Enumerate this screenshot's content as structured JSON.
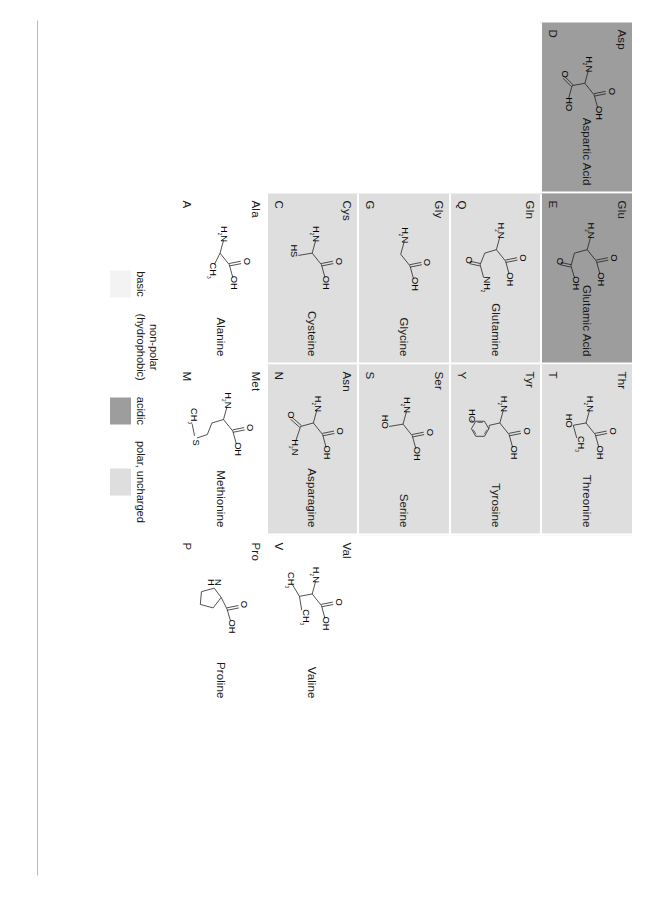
{
  "chart_data": {
    "type": "table",
    "orientation": "rotated-90-clockwise",
    "columns": [
      "one_letter_code",
      "three_letter_abbr",
      "structure",
      "full_name",
      "category"
    ],
    "grid_rows": 5,
    "grid_cols": 5,
    "colors": {
      "acidic": "#9d9d9d",
      "polar_uncharged": "#dedede",
      "basic": "#f3f3f3",
      "non_polar": "#ffffff",
      "page_rule": "#b9b9b9"
    },
    "legend": {
      "position": "below-grid-center",
      "entries": [
        {
          "label": "basic",
          "swatch": "#f3f3f3",
          "key": "basic"
        },
        {
          "label": "non-polar\n(hydrophobic)",
          "swatch": "#ffffff",
          "key": "non-polar"
        },
        {
          "label": "acidic",
          "swatch": "#9d9d9d",
          "key": "acidic"
        },
        {
          "label": "polar, uncharged",
          "swatch": "#dedede",
          "key": "polar"
        }
      ]
    },
    "cells": [
      {
        "code": "D",
        "abbr": "Asp",
        "name": "Aspartic Acid",
        "category": "acidic",
        "filled": true
      },
      {
        "code": "E",
        "abbr": "Glu",
        "name": "Glutamic Acid",
        "category": "acidic",
        "filled": true
      },
      {
        "code": "T",
        "abbr": "Thr",
        "name": "Threonine",
        "category": "polar",
        "filled": true
      },
      {
        "code": "",
        "abbr": "",
        "name": "",
        "category": "empty",
        "filled": false
      },
      {
        "code": "",
        "abbr": "",
        "name": "",
        "category": "empty",
        "filled": false
      },
      {
        "code": "",
        "abbr": "",
        "name": "",
        "category": "empty",
        "filled": false
      },
      {
        "code": "Q",
        "abbr": "Gln",
        "name": "Glutamine",
        "category": "polar",
        "filled": true
      },
      {
        "code": "Y",
        "abbr": "Tyr",
        "name": "Tyrosine",
        "category": "polar",
        "filled": true
      },
      {
        "code": "",
        "abbr": "",
        "name": "",
        "category": "empty",
        "filled": false
      },
      {
        "code": "",
        "abbr": "",
        "name": "",
        "category": "empty",
        "filled": false
      },
      {
        "code": "",
        "abbr": "",
        "name": "",
        "category": "empty",
        "filled": false
      },
      {
        "code": "G",
        "abbr": "Gly",
        "name": "Glycine",
        "category": "polar",
        "filled": true
      },
      {
        "code": "S",
        "abbr": "Ser",
        "name": "Serine",
        "category": "polar",
        "filled": true
      },
      {
        "code": "",
        "abbr": "",
        "name": "",
        "category": "empty",
        "filled": false
      },
      {
        "code": "",
        "abbr": "",
        "name": "",
        "category": "empty",
        "filled": false
      },
      {
        "code": "",
        "abbr": "",
        "name": "",
        "category": "empty",
        "filled": false
      },
      {
        "code": "C",
        "abbr": "Cys",
        "name": "Cysteine",
        "category": "polar",
        "filled": true
      },
      {
        "code": "N",
        "abbr": "Asn",
        "name": "Asparagine",
        "category": "polar",
        "filled": true
      },
      {
        "code": "V",
        "abbr": "Val",
        "name": "Valine",
        "category": "non-polar",
        "filled": true
      },
      {
        "code": "",
        "abbr": "",
        "name": "",
        "category": "empty",
        "filled": false
      },
      {
        "code": "",
        "abbr": "",
        "name": "",
        "category": "empty",
        "filled": false
      },
      {
        "code": "A",
        "abbr": "Ala",
        "name": "Alanine",
        "category": "non-polar",
        "filled": true
      },
      {
        "code": "M",
        "abbr": "Met",
        "name": "Methionine",
        "category": "non-polar",
        "filled": true
      },
      {
        "code": "P",
        "abbr": "Pro",
        "name": "Proline",
        "category": "non-polar",
        "filled": true
      },
      {
        "code": "",
        "abbr": "",
        "name": "",
        "category": "empty",
        "filled": false
      },
      {
        "code": "F",
        "abbr": "Phe",
        "name": "Phenylalanine",
        "category": "non-polar",
        "filled": true
      },
      {
        "code": "L",
        "abbr": "Leu",
        "name": "Leucine",
        "category": "non-polar",
        "filled": true
      },
      {
        "code": "W",
        "abbr": "Trp",
        "name": "Tryptophan",
        "category": "non-polar",
        "filled": true
      },
      {
        "code": "H",
        "abbr": "His",
        "name": "Histidine",
        "category": "basic",
        "filled": true
      },
      {
        "code": "R",
        "abbr": "Arg",
        "name": "Arginine",
        "category": "basic",
        "filled": true
      },
      {
        "code": "K",
        "abbr": "Lys",
        "name": "Lysine",
        "category": "basic",
        "filled": true
      },
      {
        "code": "I",
        "abbr": "Ile",
        "name": "Isoleucine",
        "category": "non-polar",
        "filled": true
      }
    ],
    "rows_layout": [
      [
        "D",
        "E",
        "T",
        "",
        ""
      ],
      [
        "",
        "Q",
        "Y",
        "",
        ""
      ],
      [
        "",
        "G",
        "S",
        "",
        ""
      ],
      [
        "",
        "C",
        "N",
        "V",
        ""
      ],
      [
        "",
        "A",
        "M",
        "P",
        ""
      ]
    ],
    "structure_labels": {
      "D": [
        "O",
        "OH",
        "H₂N",
        "O",
        "HO"
      ],
      "E": [
        "O",
        "OH",
        "H₂N",
        "O",
        "OH"
      ],
      "T": [
        "O",
        "OH",
        "H₂N",
        "HO",
        "CH₃"
      ],
      "Q": [
        "O",
        "OH",
        "H₂N",
        "O",
        "NH₂"
      ],
      "Y": [
        "O",
        "OH",
        "H₂N",
        "HO"
      ],
      "G": [
        "O",
        "OH",
        "H₂N"
      ],
      "S": [
        "O",
        "OH",
        "H₂N",
        "HO"
      ],
      "C": [
        "O",
        "OH",
        "H₂N",
        "HS"
      ],
      "N": [
        "O",
        "OH",
        "H₂N",
        "O",
        "H₂N"
      ],
      "V": [
        "O",
        "OH",
        "H₂N",
        "CH₃",
        "CH₃"
      ],
      "A": [
        "O",
        "OH",
        "H₂N",
        "CH₃"
      ],
      "M": [
        "O",
        "OH",
        "H₂N",
        "S",
        "CH₃"
      ],
      "P": [
        "O",
        "OH",
        "N",
        "H"
      ],
      "F": [
        "O",
        "OH",
        "H₂N"
      ],
      "L": [
        "O",
        "OH",
        "H₂N",
        "CH₃",
        "CH₃"
      ],
      "W": [
        "O",
        "OH",
        "H₂N",
        "HN"
      ],
      "H": [
        "O",
        "OH",
        "H₂N",
        "N",
        "N",
        "H"
      ],
      "R": [
        "O",
        "OH",
        "H₂N",
        "NH",
        "NH₂",
        "HN"
      ],
      "K": [
        "O",
        "OH",
        "H₂N",
        "H₂N"
      ],
      "I": [
        "O",
        "OH",
        "H₂N",
        "CH₃",
        "CH₃"
      ]
    }
  }
}
